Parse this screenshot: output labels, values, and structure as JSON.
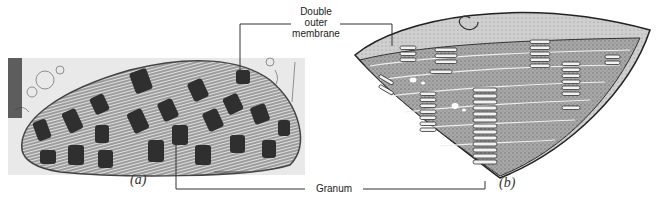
{
  "figure": {
    "panels": [
      {
        "id": "a",
        "label": "(a)",
        "description": "Electron micrograph of a chloroplast"
      },
      {
        "id": "b",
        "label": "(b)",
        "description": "Three-dimensional cutaway illustration of a chloroplast"
      }
    ],
    "annotations": [
      {
        "id": "outer-membrane",
        "text_lines": [
          "Double",
          "outer",
          "membrane"
        ]
      },
      {
        "id": "granum",
        "text": "Granum"
      }
    ],
    "colors": {
      "background": "#ffffff",
      "leader_line": "#333333",
      "micrograph_dark": "#2a2a2a",
      "micrograph_mid": "#8a8a8a",
      "micrograph_light": "#e4e4e4",
      "illustration_fill": "#9a9a9a",
      "illustration_light": "#d0d0d0"
    }
  }
}
